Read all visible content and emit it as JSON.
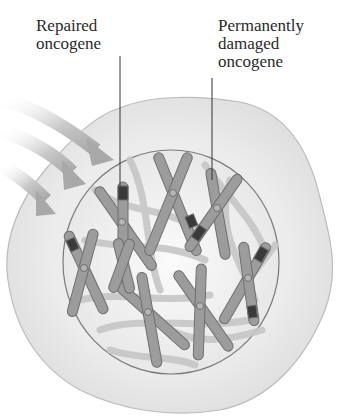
{
  "labels": {
    "repaired": [
      "Repaired",
      "oncogene"
    ],
    "damaged": [
      "Permanently",
      "damaged",
      "oncogene"
    ]
  },
  "colors": {
    "cytoplasm": "#e6e6e6",
    "cell_outline": "#b8b8b8",
    "nucleus": "#f2f2f2",
    "nucleus_outline": "#7a7a7a",
    "chromosome": "#9a9a9a",
    "chromatin": "#c4c4c4",
    "damage_band": "#3a3a3a",
    "arrow": "#bdbdbd"
  },
  "elements": {
    "arrows_count": 3,
    "chromosomes_count": 8
  }
}
